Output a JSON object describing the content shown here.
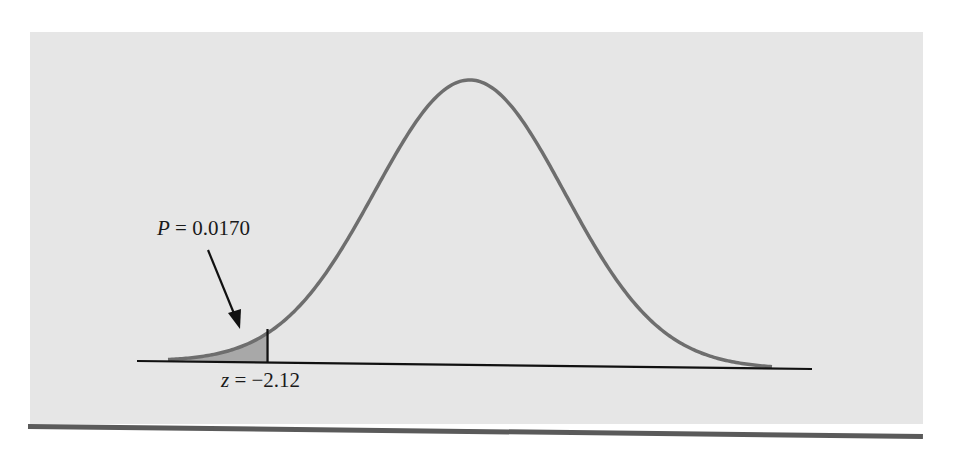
{
  "chart_data": {
    "type": "area",
    "title": "",
    "distribution": "normal",
    "mean": 0,
    "sd": 1,
    "shaded_region": {
      "from": "-inf",
      "to": -2.12,
      "area": 0.017
    },
    "annotations": [
      {
        "text": "P = 0.0170",
        "points_to": "shaded left tail"
      },
      {
        "text": "z = −2.12",
        "position": "below axis at cutoff"
      }
    ],
    "xlabel": "",
    "ylabel": "",
    "grid": false,
    "legend": null
  },
  "labels": {
    "p_var": "P",
    "p_eq": " = 0.0170",
    "z_var": "z",
    "z_eq": " = −2.12"
  },
  "colors": {
    "panel": "#e6e6e6",
    "curve": "#6e6e6e",
    "shade": "#a8a8a8",
    "axis": "#111111",
    "rule": "#5a5a5a"
  }
}
